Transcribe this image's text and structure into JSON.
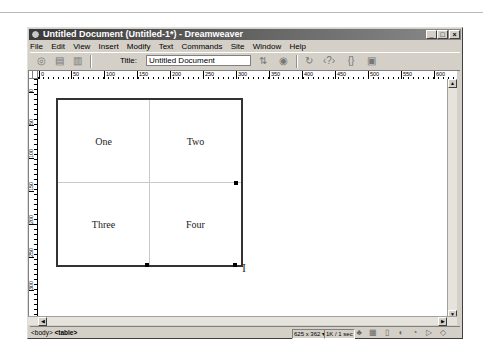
{
  "window": {
    "title": "Untitled Document (Untitled-1*) - Dreamweaver",
    "controls": {
      "minimize": "_",
      "maximize": "□",
      "close": "×"
    }
  },
  "menu": [
    "File",
    "Edit",
    "View",
    "Insert",
    "Modify",
    "Text",
    "Commands",
    "Site",
    "Window",
    "Help"
  ],
  "toolbar": {
    "view_buttons": [
      "code-view",
      "code-design-view",
      "design-view"
    ],
    "title_label": "Title:",
    "title_value": "Untitled Document",
    "icons": [
      "file-management-icon",
      "preview-browser-icon",
      "refresh-icon",
      "reference-icon",
      "code-navigation-icon",
      "view-options-icon"
    ]
  },
  "rulers": {
    "horizontal": [
      "0",
      "50",
      "100",
      "150",
      "200",
      "250",
      "300",
      "350",
      "400",
      "450",
      "500",
      "550",
      "600"
    ],
    "vertical": [
      "0",
      "50",
      "100",
      "150",
      "200",
      "250",
      "300"
    ]
  },
  "table": {
    "rows": [
      [
        "One",
        "Two"
      ],
      [
        "Three",
        "Four"
      ]
    ]
  },
  "statusbar": {
    "tag_body": "<body>",
    "tag_table": "<table>",
    "window_size": "625 x 362",
    "download": "1K / 1 sec",
    "launcher_icons": [
      "site-icon",
      "assets-icon",
      "html-styles-icon",
      "css-styles-icon",
      "behaviors-icon",
      "history-icon",
      "code-inspector-icon"
    ]
  }
}
